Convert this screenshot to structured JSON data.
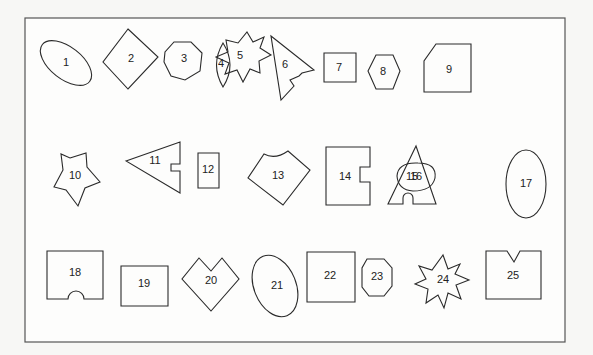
{
  "figure": {
    "frame": {
      "x": 25,
      "y": 18,
      "width": 540,
      "height": 324
    },
    "stroke_color": "#2a2a2a",
    "frame_color": "#555555",
    "background": "#fdfdfc"
  },
  "shapes": [
    {
      "id": 1,
      "label": "1",
      "name": "shape-1-tilted-ellipse",
      "kind": "ellipse",
      "cx": 66,
      "cy": 63,
      "rx": 30,
      "ry": 16,
      "rotate": 38,
      "lx": 66,
      "ly": 63
    },
    {
      "id": 2,
      "label": "2",
      "name": "shape-2-diamond",
      "kind": "polygon",
      "points": "128,29 158,57 128,89 103,62",
      "lx": 131,
      "ly": 59
    },
    {
      "id": 3,
      "label": "3",
      "name": "shape-3-heptagon",
      "kind": "polygon",
      "points": "174,42 191,42 202,53 200,71 185,80 171,76 164,62 165,52",
      "lx": 184,
      "ly": 59
    },
    {
      "id": 4,
      "label": "4",
      "name": "shape-4-lens",
      "kind": "path",
      "d": "M223,43 Q237,65 223,87 Q210,65 223,43 Z",
      "lx": 221,
      "ly": 64
    },
    {
      "id": 5,
      "label": "5",
      "name": "shape-5-seven-point-star",
      "kind": "polygon",
      "points": "247,32 253,42 264,37 260,48 271,55 259,61 260,73 250,69 243,82 237,70 225,74 229,63 216,57 228,52 226,40 238,43",
      "lx": 240,
      "ly": 56
    },
    {
      "id": 6,
      "label": "6",
      "name": "shape-6-notched-triangle",
      "kind": "polygon",
      "points": "271,36 314,70 302,73 299,76 290,80 294,86 281,100",
      "lx": 285,
      "ly": 65
    },
    {
      "id": 7,
      "label": "7",
      "name": "shape-7-rectangle",
      "kind": "polygon",
      "points": "324,53 356,53 356,82 324,82",
      "lx": 339,
      "ly": 68
    },
    {
      "id": 8,
      "label": "8",
      "name": "shape-8-hexagon",
      "kind": "polygon",
      "points": "376,55 393,55 400,71 393,89 376,89 368,71",
      "lx": 383,
      "ly": 72
    },
    {
      "id": 9,
      "label": "9",
      "name": "shape-9-cut-corner-pentagon",
      "kind": "polygon",
      "points": "436,44 471,44 471,92 424,92 424,61",
      "lx": 449,
      "ly": 70
    },
    {
      "id": 10,
      "label": "10",
      "name": "shape-10-five-point-star",
      "kind": "polygon",
      "points": "70,158 86,153 87,167 100,182 85,188 78,206 66,190 54,187 63,170 61,154",
      "lx": 75,
      "ly": 176
    },
    {
      "id": 11,
      "label": "11",
      "name": "shape-11-notched-triangle",
      "kind": "polygon",
      "points": "127,142 181,142 181,164 172,164 172,171 181,171 181,193 126,162 ",
      "lx": 155,
      "ly": 161,
      "override_points": "126,161 180,142 180,164 171,164 171,171 180,171 180,193"
    },
    {
      "id": 12,
      "label": "12",
      "name": "shape-12-square",
      "kind": "polygon",
      "points": "198,153 219,153 219,188 198,188",
      "lx": 208,
      "ly": 170
    },
    {
      "id": 13,
      "label": "13",
      "name": "shape-13-pentagon-scalloped",
      "kind": "path",
      "d": "M264,154 Q275,160 288,151 L310,170 L283,205 L248,178 Z",
      "lx": 278,
      "ly": 176
    },
    {
      "id": 14,
      "label": "14",
      "name": "shape-14-notched-rectangle",
      "kind": "polygon",
      "points": "326,147 370,147 370,167 360,167 360,182 370,182 370,205 326,205",
      "lx": 345,
      "ly": 177
    },
    {
      "id": 15,
      "label": "15",
      "name": "shape-15-arched-triangle",
      "kind": "path",
      "d": "M416,146 L436,204 L413,204 L413,198 A5,5 0 0 0 403,198 L403,204 L388,204 Z",
      "lx": 412,
      "ly": 177
    },
    {
      "id": 16,
      "label": "16",
      "name": "shape-16-egg",
      "kind": "path",
      "d": "M397,176 Q398,162 418,163 Q437,163 435,178 Q432,191 413,191 Q398,190 397,176 Z",
      "lx": 416,
      "ly": 177
    },
    {
      "id": 17,
      "label": "17",
      "name": "shape-17-vertical-ellipse",
      "kind": "ellipse",
      "cx": 526,
      "cy": 184,
      "rx": 20,
      "ry": 34,
      "rotate": 0,
      "lx": 526,
      "ly": 184
    },
    {
      "id": 18,
      "label": "18",
      "name": "shape-18-arched-rectangle",
      "kind": "path",
      "d": "M47,251 L103,251 L103,299 L84,299 A8,8 0 0 0 68,299 L47,299 Z",
      "lx": 75,
      "ly": 273
    },
    {
      "id": 19,
      "label": "19",
      "name": "shape-19-rectangle",
      "kind": "polygon",
      "points": "121,266 168,266 168,306 121,306",
      "lx": 144,
      "ly": 284
    },
    {
      "id": 20,
      "label": "20",
      "name": "shape-20-notched-diamond",
      "kind": "polygon",
      "points": "199,258 211,271 222,258 239,279 211,311 182,279",
      "lx": 211,
      "ly": 281
    },
    {
      "id": 21,
      "label": "21",
      "name": "shape-21-tilted-ellipse",
      "kind": "ellipse",
      "cx": 275,
      "cy": 286,
      "rx": 21,
      "ry": 32,
      "rotate": -22,
      "lx": 277,
      "ly": 286
    },
    {
      "id": 22,
      "label": "22",
      "name": "shape-22-square",
      "kind": "polygon",
      "points": "307,252 355,252 355,302 307,302",
      "lx": 330,
      "ly": 276
    },
    {
      "id": 23,
      "label": "23",
      "name": "shape-23-octagon",
      "kind": "polygon",
      "points": "367,259 384,259 392,268 392,286 384,296 369,296 362,287 362,268",
      "lx": 377,
      "ly": 277
    },
    {
      "id": 24,
      "label": "24",
      "name": "shape-24-ten-point-star",
      "kind": "polygon",
      "points": "443,255 448,269 460,264 455,274 469,280 456,285 461,299 448,293 444,308 438,295 426,303 428,289 415,284 426,279 419,266 432,270",
      "lx": 443,
      "ly": 280
    },
    {
      "id": 25,
      "label": "25",
      "name": "shape-25-notched-square",
      "kind": "polygon",
      "points": "486,251 507,251 514,262 520,251 541,251 541,299 486,299",
      "lx": 513,
      "ly": 276
    }
  ]
}
